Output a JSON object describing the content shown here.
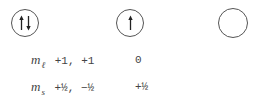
{
  "orbitals": [
    {
      "ml": "+1",
      "electrons": [
        "up",
        "down"
      ]
    },
    {
      "ml": "0",
      "electrons": [
        "up"
      ]
    },
    {
      "ml": "-1",
      "electrons": []
    }
  ],
  "rows": {
    "ml": {
      "symbol": "m",
      "subscript": "ℓ",
      "values_left": "+1, +1",
      "value_mid": "0"
    },
    "ms": {
      "symbol": "m",
      "subscript": "s",
      "values_left": "+½, −½",
      "value_mid": "+½"
    }
  },
  "colors": {
    "stroke": "#555555",
    "text": "#444444"
  }
}
